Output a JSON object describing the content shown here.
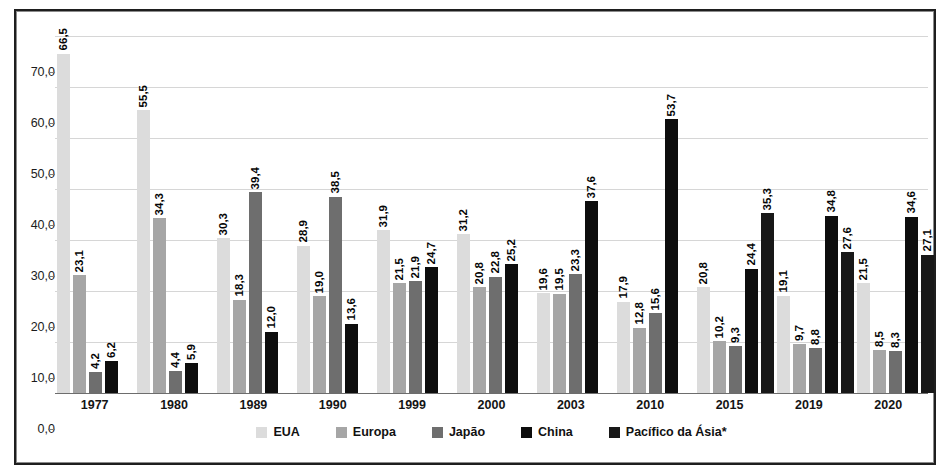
{
  "chart_data": {
    "type": "bar",
    "title": "",
    "subtitle": "",
    "xlabel": "",
    "ylabel": "",
    "ylim": [
      0,
      70
    ],
    "ytick_labels": [
      "0,0",
      "10,0",
      "20,0",
      "30,0",
      "40,0",
      "50,0",
      "60,0",
      "70,0"
    ],
    "ytick_values": [
      0,
      10,
      20,
      30,
      40,
      50,
      60,
      70
    ],
    "grid": true,
    "legend_position": "bottom",
    "decimal_separator": ",",
    "categories": [
      "1977",
      "1980",
      "1989",
      "1990",
      "1999",
      "2000",
      "2003",
      "2010",
      "2015",
      "2019",
      "2020"
    ],
    "series": [
      {
        "name": "EUA",
        "color": "#dcdcdc",
        "values": [
          66.5,
          55.5,
          30.3,
          28.9,
          31.9,
          31.2,
          19.6,
          17.9,
          20.8,
          19.1,
          21.5
        ],
        "labels": [
          "66,5",
          "55,5",
          "30,3",
          "28,9",
          "31,9",
          "31,2",
          "19,6",
          "17,9",
          "20,8",
          "19,1",
          "21,5"
        ]
      },
      {
        "name": "Europa",
        "color": "#a6a6a6",
        "values": [
          23.1,
          34.3,
          18.3,
          19.0,
          21.5,
          20.8,
          19.5,
          12.8,
          10.2,
          9.7,
          8.5
        ],
        "labels": [
          "23,1",
          "34,3",
          "18,3",
          "19,0",
          "21,5",
          "20,8",
          "19,5",
          "12,8",
          "10,2",
          "9,7",
          "8,5"
        ]
      },
      {
        "name": "Japão",
        "color": "#6e6e6e",
        "values": [
          4.2,
          4.4,
          39.4,
          38.5,
          21.9,
          22.8,
          23.3,
          15.6,
          9.3,
          8.8,
          8.3
        ],
        "labels": [
          "4,2",
          "4,4",
          "39,4",
          "38,5",
          "21,9",
          "22,8",
          "23,3",
          "15,6",
          "9,3",
          "8,8",
          "8,3"
        ]
      },
      {
        "name": "China",
        "color": "#0d0d0d",
        "values": [
          6.2,
          5.9,
          12.0,
          13.6,
          24.7,
          25.2,
          37.6,
          53.7,
          24.4,
          34.8,
          34.6
        ],
        "labels": [
          "6,2",
          "5,9",
          "12,0",
          "13,6",
          "24,7",
          "25,2",
          "37,6",
          "53,7",
          "24,4",
          "34,8",
          "34,6"
        ]
      },
      {
        "name": "Pacífico da Ásia*",
        "color": "#181818",
        "values": [
          null,
          null,
          null,
          null,
          null,
          null,
          null,
          null,
          35.3,
          27.6,
          27.1
        ],
        "labels": [
          "",
          "",
          "",
          "",
          "",
          "",
          "",
          "",
          "35,3",
          "27,6",
          "27,1"
        ]
      }
    ]
  },
  "legend": {
    "items": [
      {
        "label": "EUA",
        "swatch": "legend-swatch-eua"
      },
      {
        "label": "Europa",
        "swatch": "legend-swatch-europa"
      },
      {
        "label": "Japão",
        "swatch": "legend-swatch-japao"
      },
      {
        "label": "China",
        "swatch": "legend-swatch-china"
      },
      {
        "label": "Pacífico da Ásia*",
        "swatch": "legend-swatch-pacifico"
      }
    ]
  }
}
